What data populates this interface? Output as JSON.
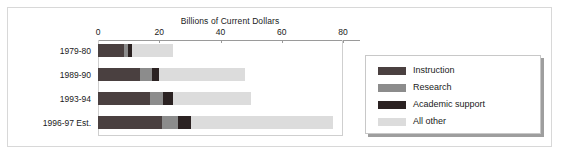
{
  "chart_data": {
    "type": "bar",
    "orientation": "horizontal",
    "stacked": true,
    "title": "Billions of Current Dollars",
    "xlabel": "",
    "ylabel": "",
    "xlim": [
      0,
      80
    ],
    "xticks": [
      0,
      20,
      40,
      60,
      80
    ],
    "xtick_labels": [
      "0",
      "20",
      "40",
      "60",
      "80"
    ],
    "grid": false,
    "legend_position": "right-outside",
    "categories": [
      "1979-80",
      "1989-90",
      "1993-94",
      "1996-97 Est."
    ],
    "series": [
      {
        "name": "Instruction",
        "color": "#4a4040",
        "values": [
          8.5,
          13.8,
          17.0,
          21.0
        ]
      },
      {
        "name": "Research",
        "color": "#8c8c8c",
        "values": [
          1.2,
          3.7,
          4.3,
          5.0
        ]
      },
      {
        "name": "Academic support",
        "color": "#2b2222",
        "values": [
          1.3,
          2.5,
          3.2,
          4.5
        ]
      },
      {
        "name": "All other",
        "color": "#dcdcdc",
        "values": [
          13.5,
          28.0,
          25.5,
          46.1
        ]
      }
    ],
    "totals": [
      24.5,
      48.0,
      50.0,
      76.6
    ]
  },
  "colors": {
    "frame": "#d8d8d8",
    "axis": "#9a9a9a",
    "plot_border": "#cfcfcf",
    "legend_border": "#c8c8c8",
    "legend_shadow": "#9e9e9e",
    "text": "#1a1a1a",
    "background": "#ffffff"
  }
}
